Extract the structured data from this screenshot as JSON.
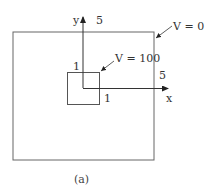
{
  "diagram": {
    "caption": "(a)",
    "colors": {
      "line": "#555555",
      "text": "#333333",
      "background": "#ffffff"
    },
    "outer_boundary": {
      "label": "V = 0",
      "side_length_label": "5"
    },
    "inner_boundary": {
      "label": "V = 100",
      "side_length_label_top": "1",
      "side_length_label_right": "1"
    },
    "axes": {
      "x_label": "x",
      "y_label": "y",
      "y_extent_label": "5",
      "x_extent_label": "5"
    }
  }
}
